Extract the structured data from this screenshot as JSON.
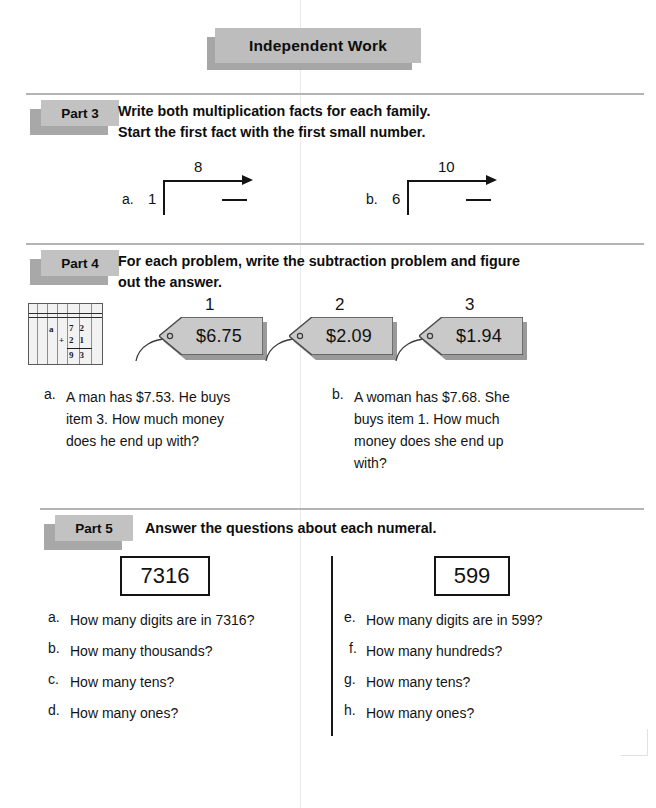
{
  "title": "Independent Work",
  "parts": [
    {
      "label": "Part 3",
      "instruction_line1": "Write both multiplication facts for each family.",
      "instruction_line2_pre": "Start the first fact with the ",
      "instruction_line2_bold": "first",
      "instruction_line2_post": " small number.",
      "families": [
        {
          "letter": "a.",
          "start_number": "1",
          "top_number": "8"
        },
        {
          "letter": "b.",
          "start_number": "6",
          "top_number": "10"
        }
      ]
    },
    {
      "label": "Part 4",
      "instruction_line1": "For each problem, write the subtraction problem and figure",
      "instruction_line2": "out the answer.",
      "notebook_icon": {
        "name": "lined-paper-addition-icon",
        "item_letter": "a",
        "addend_top": "72",
        "addend_bottom": "21",
        "plus_sign": "+",
        "sum": "93"
      },
      "price_tags": [
        {
          "number": "1",
          "price": "$6.75"
        },
        {
          "number": "2",
          "price": "$2.09"
        },
        {
          "number": "3",
          "price": "$1.94"
        }
      ],
      "questions": [
        {
          "letter": "a.",
          "lines": [
            "A man has $7.53.  He buys",
            "item 3.  How much money",
            "does he end up with?"
          ]
        },
        {
          "letter": "b.",
          "lines": [
            "A woman has $7.68.  She",
            "buys item 1.  How much",
            "money does she end up",
            "with?"
          ]
        }
      ]
    },
    {
      "label": "Part 5",
      "instruction_line1": "Answer the questions about each numeral.",
      "numerals": [
        {
          "value": "7316"
        },
        {
          "value": "599"
        }
      ],
      "questions_left": [
        {
          "letter": "a.",
          "text": "How many digits are in 7316?"
        },
        {
          "letter": "b.",
          "text": "How many thousands?"
        },
        {
          "letter": "c.",
          "text": "How many tens?"
        },
        {
          "letter": "d.",
          "text": "How many ones?"
        }
      ],
      "questions_right": [
        {
          "letter": "e.",
          "text": "How many digits are in 599?"
        },
        {
          "letter": "f.",
          "text": "How many hundreds?"
        },
        {
          "letter": "g.",
          "text": "How many tens?"
        },
        {
          "letter": "h.",
          "text": "How many ones?"
        }
      ]
    }
  ],
  "colors": {
    "banner_fill": "#bdbdbd",
    "banner_shadow": "#a6a6a6",
    "chip_fill": "#c2c2c2",
    "chip_shadow": "#a8a8a8",
    "tag_fill": "#c9c9c9",
    "tag_shadow": "#9a9a9a",
    "rule": "#b4b4b4",
    "ink": "#141414"
  }
}
